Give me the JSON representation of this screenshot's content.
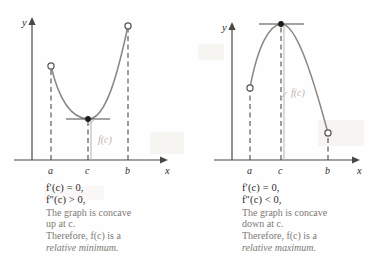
{
  "figure_title": "Second Derivative Test",
  "colors": {
    "axis": "#4a4845",
    "curve": "#8a8782",
    "dash": "#3d3b39",
    "annotation": "#b9b3a8",
    "text_dark": "#2c2a28",
    "text_gray": "#7d7975",
    "background": "#fefefe"
  },
  "panels": [
    {
      "id": "relative-minimum",
      "axes": {
        "y_label": "y",
        "x_label": "x",
        "ticks": [
          "a",
          "c",
          "b"
        ]
      },
      "annotation_label": "f(c)",
      "caption": {
        "condition_1": "f′(c) = 0,",
        "condition_2": "f″(c) > 0,",
        "line_1": "The graph is concave",
        "line_2": "up at c.",
        "line_3": "Therefore, f(c) is a",
        "line_4": "relative minimum."
      }
    },
    {
      "id": "relative-maximum",
      "axes": {
        "y_label": "y",
        "x_label": "x",
        "ticks": [
          "a",
          "c",
          "b"
        ]
      },
      "annotation_label": "f(c)",
      "caption": {
        "condition_1": "f′(c) = 0,",
        "condition_2": "f″(c) < 0,",
        "line_1": "The graph is concave",
        "line_2": "down at c.",
        "line_3": "Therefore, f(c) is a",
        "line_4": "relative maximum."
      }
    }
  ],
  "chart_data": [
    {
      "type": "line",
      "title": "Relative minimum: concave up at c",
      "xlabel": "x",
      "ylabel": "y",
      "xlim": [
        0,
        1
      ],
      "ylim": [
        0,
        1
      ],
      "grid": false,
      "legend": "none",
      "x_ticks": [
        "a",
        "c",
        "b"
      ],
      "x_tick_positions": [
        0.27,
        0.47,
        0.79
      ],
      "curve_shape": "parabola-up",
      "vertex": {
        "x": "c",
        "y": 0.3,
        "marker": "filled-dot",
        "tangent": "horizontal"
      },
      "endpoints": [
        {
          "x": "a",
          "y": 0.72,
          "marker": "open-circle"
        },
        {
          "x": "b",
          "y": 0.95,
          "marker": "open-circle"
        }
      ],
      "annotations": [
        {
          "text": "f(c)",
          "meaning": "function value at c, measured from x-axis to vertex"
        }
      ],
      "dashed_verticals": [
        "a",
        "c",
        "b"
      ]
    },
    {
      "type": "line",
      "title": "Relative maximum: concave down at c",
      "xlabel": "x",
      "ylabel": "y",
      "xlim": [
        0,
        1
      ],
      "ylim": [
        0,
        1
      ],
      "grid": false,
      "legend": "none",
      "x_ticks": [
        "a",
        "c",
        "b"
      ],
      "x_tick_positions": [
        0.27,
        0.47,
        0.79
      ],
      "curve_shape": "parabola-down",
      "vertex": {
        "x": "c",
        "y": 0.95,
        "marker": "filled-dot",
        "tangent": "horizontal"
      },
      "endpoints": [
        {
          "x": "a",
          "y": 0.45,
          "marker": "open-circle"
        },
        {
          "x": "b",
          "y": 0.16,
          "marker": "open-circle"
        }
      ],
      "annotations": [
        {
          "text": "f(c)",
          "meaning": "function value at c, measured from x-axis to vertex"
        }
      ],
      "dashed_verticals": [
        "a",
        "c",
        "b"
      ]
    }
  ]
}
